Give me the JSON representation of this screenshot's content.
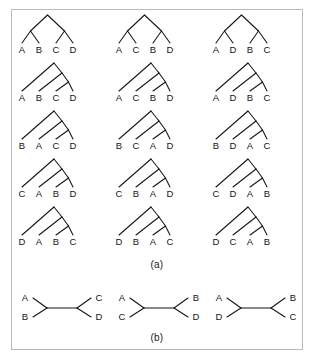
{
  "figure": {
    "caption_a": "(a)",
    "caption_b": "(b)",
    "line_color": "#141414",
    "border_color": "#b9b9b9",
    "background_color": "#ffffff"
  },
  "panel_a": {
    "description": "Rooted trees for four taxa arranged in five rows and three columns",
    "rows": 5,
    "columns": 3,
    "trees": [
      {
        "shape": "balanced",
        "row": 1,
        "col": 1,
        "leaves": [
          "A",
          "B",
          "C",
          "D"
        ]
      },
      {
        "shape": "balanced",
        "row": 1,
        "col": 2,
        "leaves": [
          "A",
          "C",
          "B",
          "D"
        ]
      },
      {
        "shape": "balanced",
        "row": 1,
        "col": 3,
        "leaves": [
          "A",
          "D",
          "B",
          "C"
        ]
      },
      {
        "shape": "caterpillar",
        "row": 2,
        "col": 1,
        "leaves": [
          "A",
          "B",
          "C",
          "D"
        ]
      },
      {
        "shape": "caterpillar",
        "row": 2,
        "col": 2,
        "leaves": [
          "A",
          "C",
          "B",
          "D"
        ]
      },
      {
        "shape": "caterpillar",
        "row": 2,
        "col": 3,
        "leaves": [
          "A",
          "D",
          "B",
          "C"
        ]
      },
      {
        "shape": "caterpillar",
        "row": 3,
        "col": 1,
        "leaves": [
          "B",
          "A",
          "C",
          "D"
        ]
      },
      {
        "shape": "caterpillar",
        "row": 3,
        "col": 2,
        "leaves": [
          "B",
          "C",
          "A",
          "D"
        ]
      },
      {
        "shape": "caterpillar",
        "row": 3,
        "col": 3,
        "leaves": [
          "B",
          "D",
          "A",
          "C"
        ]
      },
      {
        "shape": "caterpillar",
        "row": 4,
        "col": 1,
        "leaves": [
          "C",
          "A",
          "B",
          "D"
        ]
      },
      {
        "shape": "caterpillar",
        "row": 4,
        "col": 2,
        "leaves": [
          "C",
          "B",
          "A",
          "D"
        ]
      },
      {
        "shape": "caterpillar",
        "row": 4,
        "col": 3,
        "leaves": [
          "C",
          "D",
          "A",
          "B"
        ]
      },
      {
        "shape": "caterpillar",
        "row": 5,
        "col": 1,
        "leaves": [
          "D",
          "A",
          "B",
          "C"
        ]
      },
      {
        "shape": "caterpillar",
        "row": 5,
        "col": 2,
        "leaves": [
          "D",
          "B",
          "A",
          "C"
        ]
      },
      {
        "shape": "caterpillar",
        "row": 5,
        "col": 3,
        "leaves": [
          "D",
          "C",
          "A",
          "B"
        ]
      }
    ]
  },
  "panel_b": {
    "description": "Unrooted trees for four taxa",
    "trees": [
      {
        "index": 1,
        "top_left": "A",
        "bottom_left": "B",
        "top_right": "C",
        "bottom_right": "D"
      },
      {
        "index": 2,
        "top_left": "A",
        "bottom_left": "C",
        "top_right": "B",
        "bottom_right": "D"
      },
      {
        "index": 3,
        "top_left": "A",
        "bottom_left": "D",
        "top_right": "B",
        "bottom_right": "C"
      }
    ]
  }
}
